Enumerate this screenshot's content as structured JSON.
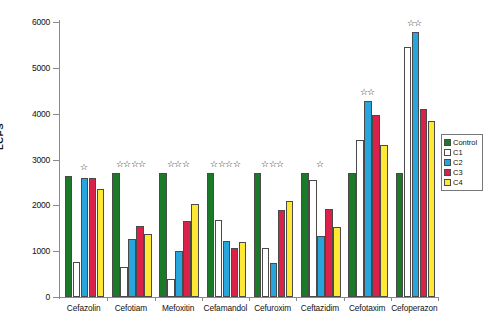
{
  "chart_data": {
    "type": "bar",
    "title": "",
    "xlabel": "",
    "ylabel": "LCPS",
    "ylim": [
      0,
      6000
    ],
    "ytick_labels": [
      "0",
      "1000",
      "2000",
      "3000",
      "4000",
      "5000",
      "6000"
    ],
    "yticks": [
      0,
      1000,
      2000,
      3000,
      4000,
      5000,
      6000
    ],
    "grid": false,
    "legend_position": "right",
    "categories": [
      "Cefazolin",
      "Cefotiam",
      "Mefoxitin",
      "Cefamandol",
      "Cefuroxim",
      "Ceftazidim",
      "Cefotaxim",
      "Cefoperazon"
    ],
    "series": [
      {
        "name": "Control",
        "color": "#1a7a28",
        "values": [
          2640,
          2700,
          2700,
          2700,
          2700,
          2700,
          2700,
          2700
        ]
      },
      {
        "name": "C1",
        "color": "#ffffff",
        "values": [
          770,
          660,
          400,
          1690,
          1080,
          2560,
          3430,
          5450
        ]
      },
      {
        "name": "C2",
        "color": "#29a5dd",
        "values": [
          2600,
          1270,
          1000,
          1220,
          750,
          1330,
          4270,
          5780
        ]
      },
      {
        "name": "C3",
        "color": "#d9214a",
        "values": [
          2600,
          1540,
          1650,
          1070,
          1890,
          1930,
          3980,
          4100
        ]
      },
      {
        "name": "C4",
        "color": "#ffe833",
        "values": [
          2350,
          1370,
          2040,
          1200,
          2100,
          1520,
          3320,
          3830
        ]
      }
    ],
    "annotations": [
      {
        "category": "Cefazolin",
        "stars": 1,
        "symbol": "☆"
      },
      {
        "category": "Cefotiam",
        "stars": 4,
        "symbol": "☆"
      },
      {
        "category": "Mefoxitin",
        "stars": 3,
        "symbol": "☆"
      },
      {
        "category": "Cefamandol",
        "stars": 4,
        "symbol": "☆"
      },
      {
        "category": "Cefuroxim",
        "stars": 3,
        "symbol": "☆"
      },
      {
        "category": "Ceftazidim",
        "stars": 1,
        "symbol": "☆"
      },
      {
        "category": "Cefotaxim",
        "stars": 2,
        "symbol": "☆ ☆"
      },
      {
        "category": "Cefoperazon",
        "stars": 2,
        "symbol": "☆ ☆"
      }
    ]
  },
  "legend": {
    "items": [
      {
        "label": "Control",
        "color": "#1a7a28"
      },
      {
        "label": "C1",
        "color": "#ffffff"
      },
      {
        "label": "C2",
        "color": "#29a5dd"
      },
      {
        "label": "C3",
        "color": "#d9214a"
      },
      {
        "label": "C4",
        "color": "#ffe833"
      }
    ]
  }
}
